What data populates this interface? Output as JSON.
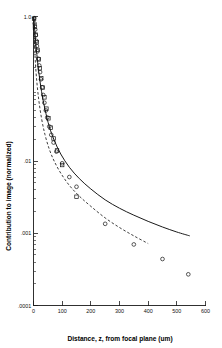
{
  "chart_data": {
    "type": "scatter",
    "title": "",
    "xlabel": "Distance, z, from focal plane (um)",
    "ylabel": "Contribution to image (normalized)",
    "xlim": [
      0,
      600
    ],
    "ylim": [
      0.0001,
      1.0
    ],
    "yscale": "log",
    "xscale": "linear",
    "grid": false,
    "legend": "none",
    "xticks": [
      0,
      100,
      200,
      300,
      400,
      500,
      600
    ],
    "xticklabels": [
      "0",
      "100",
      "200",
      "300",
      "400",
      "500",
      "600"
    ],
    "yticks": [
      1.0,
      0.01,
      0.001,
      0.0001
    ],
    "yticklabels": [
      "1.0",
      ".01",
      ".001",
      ".0001"
    ],
    "series": [
      {
        "name": "circles",
        "marker": "open-circle",
        "x": [
          2,
          4,
          6,
          8,
          10,
          12,
          14,
          17,
          20,
          23,
          26,
          30,
          34,
          38,
          43,
          48,
          55,
          62,
          70,
          80,
          100,
          125,
          150,
          250,
          350,
          450,
          540
        ],
        "y": [
          0.95,
          0.8,
          0.66,
          0.55,
          0.46,
          0.39,
          0.33,
          0.26,
          0.21,
          0.17,
          0.135,
          0.105,
          0.082,
          0.064,
          0.05,
          0.04,
          0.03,
          0.023,
          0.018,
          0.0135,
          0.0093,
          0.006,
          0.0044,
          0.00135,
          0.0007,
          0.00044,
          0.00027
        ]
      },
      {
        "name": "squares",
        "marker": "open-square",
        "x": [
          2,
          5,
          8,
          11,
          14,
          18,
          22,
          27,
          32,
          38,
          45,
          52,
          60,
          70,
          82,
          100,
          150
        ],
        "y": [
          0.93,
          0.72,
          0.56,
          0.44,
          0.345,
          0.255,
          0.192,
          0.14,
          0.104,
          0.076,
          0.053,
          0.039,
          0.029,
          0.0205,
          0.014,
          0.0088,
          0.0032
        ]
      }
    ],
    "curves": [
      {
        "name": "solid-fit",
        "style": "solid",
        "x": [
          1,
          5,
          10,
          18,
          28,
          40,
          55,
          72,
          95,
          125,
          160,
          200,
          250,
          300,
          350,
          400,
          450,
          500,
          545
        ],
        "y": [
          1.0,
          0.6,
          0.35,
          0.175,
          0.092,
          0.052,
          0.03,
          0.0195,
          0.0125,
          0.0082,
          0.0057,
          0.0041,
          0.0029,
          0.00222,
          0.00178,
          0.00146,
          0.00122,
          0.00104,
          0.00092
        ]
      },
      {
        "name": "dashed-fit",
        "style": "dashed",
        "x": [
          1,
          5,
          10,
          18,
          28,
          40,
          55,
          72,
          95,
          125,
          160,
          200,
          250,
          300,
          350,
          400
        ],
        "y": [
          0.7,
          0.3,
          0.148,
          0.072,
          0.039,
          0.0232,
          0.0146,
          0.01,
          0.0068,
          0.0046,
          0.00326,
          0.00236,
          0.00163,
          0.0012,
          0.00092,
          0.00072
        ]
      }
    ]
  }
}
